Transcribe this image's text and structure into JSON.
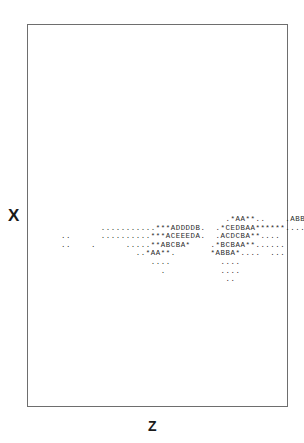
{
  "axes": {
    "y_label": "X",
    "x_label": "Z"
  },
  "chart_data": {
    "type": "heatmap",
    "title": "",
    "xlabel": "Z",
    "ylabel": "X",
    "subtitle": "",
    "grid": false,
    "legend": "none",
    "encoding": {
      "description": "ASCII density map; glyph encodes bin count level",
      "levels": [
        ".",
        "*",
        "A",
        "B",
        "C",
        "D",
        "E"
      ],
      "level_meaning": [
        "lowest",
        "low",
        "medium-low",
        "medium",
        "medium-high",
        "high",
        "highest"
      ]
    },
    "rows": [
      "                                  .*AA**..    .ABBA**.........   .  . ",
      "         ...........***ADDDDB.  .*CEDBAA******..........",
      " ..      ..........***ACEEEDA.  .ACDCBA**....",
      " ..    .      .....**ABCBA*    .*BCBAA**......",
      "                ..*AA**.       *ABBA*....  ...",
      "                   ....          ....",
      "                     .           ....",
      "                                  .."
    ],
    "annotations": []
  }
}
